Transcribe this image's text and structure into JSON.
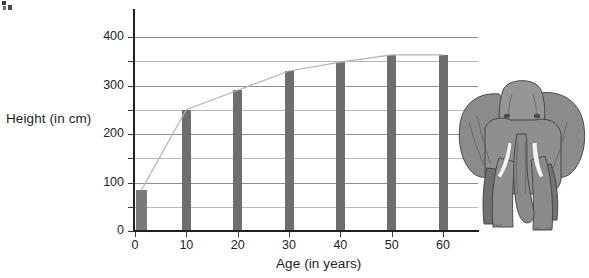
{
  "chart_data": {
    "type": "bar",
    "title": "",
    "subtitle": "",
    "xlabel": "Age (in years)",
    "ylabel": "Height (in cm)",
    "categories": [
      "0",
      "10",
      "20",
      "30",
      "40",
      "50",
      "60"
    ],
    "x": [
      0,
      10,
      20,
      30,
      40,
      50,
      60
    ],
    "values": [
      85,
      250,
      290,
      330,
      348,
      363,
      363
    ],
    "series": [
      {
        "name": "Height",
        "type": "bar",
        "values": [
          85,
          250,
          290,
          330,
          348,
          363,
          363
        ]
      },
      {
        "name": "Growth curve",
        "type": "line",
        "values": [
          85,
          250,
          290,
          330,
          348,
          363,
          363
        ]
      }
    ],
    "xlim": [
      0,
      65
    ],
    "ylim": [
      0,
      420
    ],
    "ytick_labels": [
      "0",
      "100",
      "200",
      "300",
      "400"
    ],
    "ytick_values": [
      0,
      100,
      200,
      300,
      400
    ],
    "ygrid_values": [
      50,
      100,
      150,
      200,
      250,
      300,
      350,
      400
    ],
    "xtick_labels": [
      "0",
      "10",
      "20",
      "30",
      "40",
      "50",
      "60"
    ],
    "grid": true,
    "legend": false,
    "legend_position": "none",
    "annotations": [],
    "bar_color": "#6e6e6e",
    "line_color": "#b0b0b0",
    "grid_color": "#9a9a9a",
    "axis_color": "#231f20",
    "background_color": "#ffffff"
  },
  "axes": {
    "y_title": "Height (in cm)",
    "x_title": "Age (in years)"
  },
  "illustration": {
    "name": "elephant-illustration",
    "description": "Grayscale front-facing elephant with ears, tusks and trunk",
    "body_color": "#8c8c8c",
    "shadow_color": "#6f6f6f",
    "outline_color": "#3f3f3f",
    "tusk_color": "#f2f2ee"
  }
}
